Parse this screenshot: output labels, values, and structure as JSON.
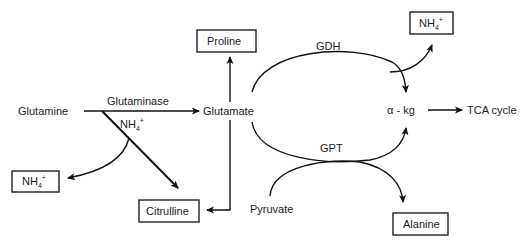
{
  "diagram": {
    "type": "metabolic-pathway",
    "nodes": {
      "glutamine": "Glutamine",
      "glutamate": "Glutamate",
      "proline": "Proline",
      "citrulline": "Citrulline",
      "nh4_left": {
        "base": "NH",
        "sub": "4",
        "sup": "+"
      },
      "nh4_mid": {
        "base": "NH",
        "sub": "4",
        "sup": "+"
      },
      "nh4_top": {
        "base": "NH",
        "sub": "4",
        "sup": "+"
      },
      "akg": "α - kg",
      "tca": "TCA cycle",
      "pyruvate": "Pyruvate",
      "alanine": "Alanine"
    },
    "enzymes": {
      "glutaminase": "Glutaminase",
      "gdh": "GDH",
      "gpt": "GPT"
    },
    "edges": [
      {
        "from": "Glutamine",
        "to": "Glutamate",
        "label": "Glutaminase"
      },
      {
        "from": "Glutamine",
        "to": "Citrulline"
      },
      {
        "from": "Glutamine",
        "to": "NH4+",
        "label": "NH4+"
      },
      {
        "from": "Glutamate",
        "to": "Proline"
      },
      {
        "from": "Glutamate",
        "to": "Citrulline"
      },
      {
        "from": "Glutamate",
        "to": "α - kg",
        "label": "GDH",
        "byproduct": "NH4+"
      },
      {
        "from": "Glutamate",
        "to": "α - kg",
        "label": "GPT"
      },
      {
        "from": "Pyruvate",
        "to": "Alanine",
        "label": "GPT"
      },
      {
        "from": "α - kg",
        "to": "TCA cycle"
      }
    ]
  }
}
